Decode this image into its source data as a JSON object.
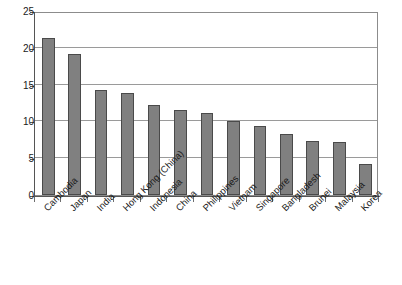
{
  "chart_data": {
    "type": "bar",
    "title": "",
    "subtitle": "",
    "xlabel": "",
    "ylabel": "",
    "ylim": [
      0,
      25
    ],
    "yticks": [
      0,
      5,
      10,
      15,
      20,
      25
    ],
    "ytick_labels": [
      "0",
      "5",
      "10",
      "15",
      "20",
      "25"
    ],
    "grid": true,
    "legend": false,
    "legend_position": "none",
    "orientation": "vertical",
    "categories": [
      "Cambodia",
      "Japan",
      "India",
      "Hong Kong (China)",
      "Indonesia",
      "China",
      "Philippines",
      "Vietnam",
      "Singapore",
      "Bangladesh",
      "Brunei",
      "Malaysia",
      "Korea"
    ],
    "values": [
      21.3,
      19.1,
      14.3,
      13.8,
      12.2,
      11.5,
      11.2,
      10.1,
      9.4,
      8.3,
      7.3,
      7.2,
      4.2
    ],
    "bar_color": "#808080",
    "bar_edge_color": "#4a4a4a",
    "gridline_color": "#9a9a9a",
    "axis_color": "#555555",
    "plot_background": "#ffffff",
    "category_label_rotation": -45
  }
}
